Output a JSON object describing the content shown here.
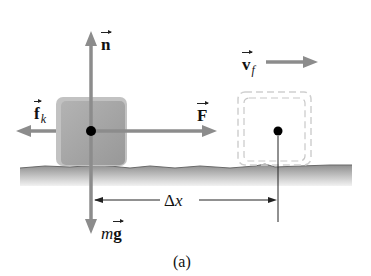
{
  "diagram": {
    "caption": "(a)",
    "colors": {
      "arrow": "#8c8c8c",
      "block_fill": "#9e9e9e",
      "block_edge": "#b8b8b8",
      "ground_top": "#7a7a7a",
      "ground_fade": "#e8e8e8",
      "dashed_outline": "#c4c4c4",
      "dot": "#000000",
      "dimension_line": "#222222"
    },
    "labels": {
      "normal_force": {
        "symbol": "n",
        "vector": true
      },
      "friction_force": {
        "symbol": "f",
        "subscript": "k",
        "vector": true
      },
      "applied_force": {
        "symbol": "F",
        "vector": true
      },
      "weight_prefix": "m",
      "weight_symbol": "g",
      "final_velocity": {
        "symbol": "v",
        "subscript": "f",
        "vector": true
      },
      "displacement": "Δx"
    },
    "elements": {
      "block_initial": "solid gray block with center dot",
      "block_final": "dashed outline block with center dot",
      "ground": "rough horizontal surface"
    }
  }
}
